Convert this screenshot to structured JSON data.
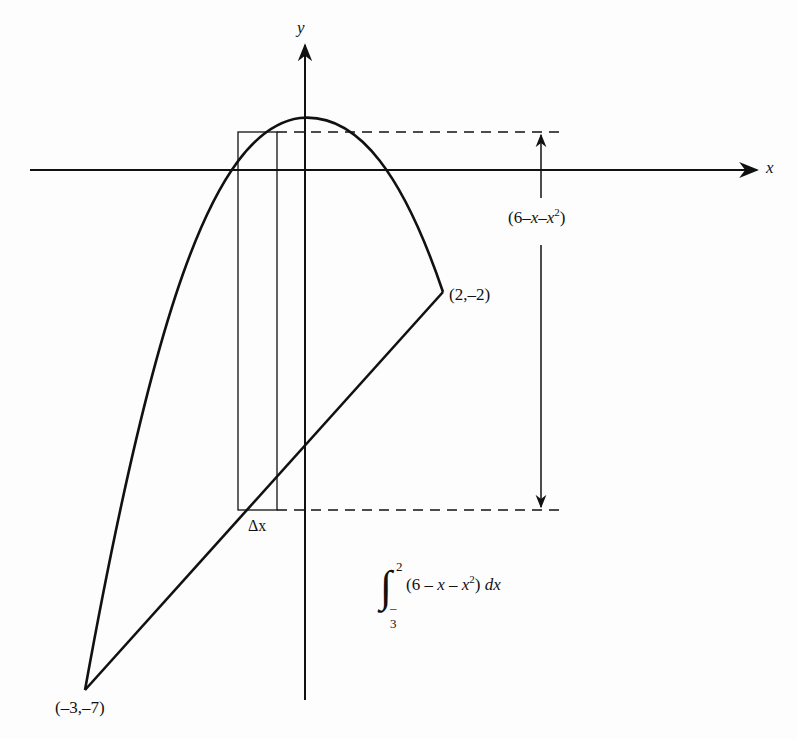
{
  "figure": {
    "axis_x_label": "x",
    "axis_y_label": "y",
    "height_label": {
      "open": "(6–",
      "x1": "x",
      "dash": "–",
      "x2": "x",
      "exp": "2",
      "close": ")"
    },
    "delta_x_label": "Δx",
    "point_right": "(2,–2)",
    "point_left": "(–3,–7)",
    "integral": {
      "upper": "2",
      "lower": "–3",
      "integrand_open": "(6 – ",
      "x1": "x",
      "minus": " – ",
      "x2": "x",
      "exp": "2",
      "close": ") ",
      "dx": "dx"
    },
    "curves": {
      "parabola": "y = 4 - x^2 (upper boundary, vertex near top)",
      "line": "y = x - 4 (lower boundary)"
    },
    "colors": {
      "ink": "#111111",
      "background": "#fdfdfd"
    }
  }
}
